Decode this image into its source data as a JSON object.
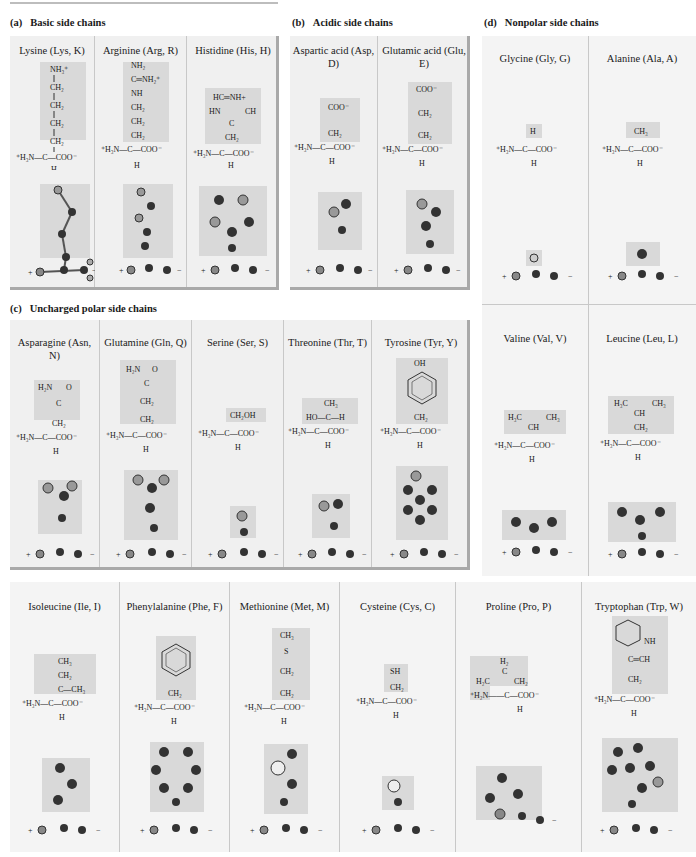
{
  "sections": {
    "a": {
      "label": "(a)",
      "title": "Basic side chains"
    },
    "b": {
      "label": "(b)",
      "title": "Acidic side chains"
    },
    "c": {
      "label": "(c)",
      "title": "Uncharged polar side chains"
    },
    "d": {
      "label": "(d)",
      "title": "Nonpolar side chains"
    }
  },
  "backbone": {
    "left": "⁺H₃N",
    "center": "C",
    "right": "COO⁻",
    "bottom": "H",
    "model_plus": "+",
    "model_minus": "−"
  },
  "amino_acids": {
    "basic": [
      {
        "name": "Lysine (Lys, K)",
        "side_chain": [
          "NH₃⁺",
          "CH₂",
          "CH₂",
          "CH₂",
          "CH₂"
        ]
      },
      {
        "name": "Arginine (Arg, R)",
        "side_chain": [
          "NH₂",
          "C═NH₂⁺",
          "NH",
          "CH₂",
          "CH₂",
          "CH₂"
        ]
      },
      {
        "name": "Histidine (His, H)",
        "side_chain": [
          "HC═NH+",
          "HN  CH",
          "C",
          "CH₂"
        ]
      }
    ],
    "acidic": [
      {
        "name": "Aspartic acid (Asp, D)",
        "side_chain": [
          "COO⁻",
          "CH₂"
        ]
      },
      {
        "name": "Glutamic acid (Glu, E)",
        "side_chain": [
          "COO⁻",
          "CH₂",
          "CH₂"
        ]
      }
    ],
    "polar": [
      {
        "name": "Asparagine (Asn, N)",
        "side_chain": [
          "H₂N  O",
          "C",
          "CH₂"
        ]
      },
      {
        "name": "Glutamine (Gln, Q)",
        "side_chain": [
          "H₂N  O",
          "C",
          "CH₂",
          "CH₂"
        ]
      },
      {
        "name": "Serine (Ser, S)",
        "side_chain": [
          "CH₂OH"
        ]
      },
      {
        "name": "Threonine (Thr, T)",
        "side_chain": [
          "CH₃",
          "HO—C—H"
        ]
      },
      {
        "name": "Tyrosine (Tyr, Y)",
        "side_chain": [
          "OH",
          "benzene-ring",
          "CH₂"
        ]
      }
    ],
    "nonpolar": [
      {
        "name": "Glycine (Gly, G)",
        "side_chain": [
          "H"
        ]
      },
      {
        "name": "Alanine (Ala, A)",
        "side_chain": [
          "CH₃"
        ]
      },
      {
        "name": "Valine (Val, V)",
        "side_chain": [
          "H₃C  CH₃",
          "CH"
        ]
      },
      {
        "name": "Leucine (Leu, L)",
        "side_chain": [
          "H₃C  CH₃",
          "CH",
          "CH₂"
        ]
      },
      {
        "name": "Isoleucine (Ile, I)",
        "side_chain": [
          "CH₃",
          "CH₂",
          "C—CH₃"
        ]
      },
      {
        "name": "Phenylalanine (Phe, F)",
        "side_chain": [
          "benzene-ring",
          "CH₂"
        ]
      },
      {
        "name": "Methionine (Met, M)",
        "side_chain": [
          "CH₃",
          "S",
          "CH₂",
          "CH₂"
        ]
      },
      {
        "name": "Cysteine (Cys, C)",
        "side_chain": [
          "SH",
          "CH₂"
        ]
      },
      {
        "name": "Proline (Pro, P)",
        "side_chain": [
          "H₂",
          "C",
          "H₂C  CH₂",
          "⁺H₂N"
        ]
      },
      {
        "name": "Tryptophan (Trp, W)",
        "side_chain": [
          "indole-ring",
          "NH",
          "C═CH",
          "CH₂"
        ]
      }
    ]
  },
  "colors": {
    "panel": "#f0f0f0",
    "highlight": "#d9d9d9",
    "shadow": "#a9a9a9",
    "divider": "#c8c8c8"
  }
}
